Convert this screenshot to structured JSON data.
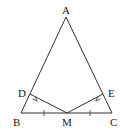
{
  "diagram": {
    "colors": {
      "stroke": "#333333",
      "background": "#ffffff",
      "text": "#222222"
    },
    "points": {
      "A": {
        "label": "A",
        "x": 66,
        "y": 17
      },
      "B": {
        "label": "B",
        "x": 21,
        "y": 113
      },
      "C": {
        "label": "C",
        "x": 112,
        "y": 113
      },
      "M": {
        "label": "M",
        "x": 67,
        "y": 113
      },
      "D": {
        "label": "D",
        "x": 30,
        "y": 94
      },
      "E": {
        "label": "E",
        "x": 103,
        "y": 94
      }
    },
    "segments": [
      "AB",
      "AC",
      "BC",
      "MD",
      "ME"
    ],
    "right_angles": [
      "D",
      "E"
    ],
    "equal_ticks": [
      "BM",
      "MC"
    ]
  }
}
